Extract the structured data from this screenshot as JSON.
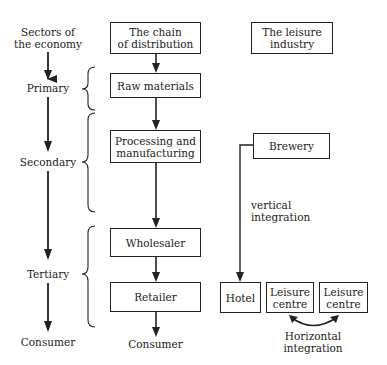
{
  "sectors": {
    "heading_line1": "Sectors of",
    "heading_line2": "the economy",
    "primary": "Primary",
    "secondary": "Secondary",
    "tertiary": "Tertiary",
    "consumer": "Consumer"
  },
  "chain": {
    "heading_line1": "The chain",
    "heading_line2": "of distribution",
    "raw_materials": "Raw materials",
    "processing_line1": "Processing and",
    "processing_line2": "manufacturing",
    "wholesaler": "Wholesaler",
    "retailer": "Retailer",
    "consumer": "Consumer"
  },
  "leisure": {
    "heading_line1": "The leisure",
    "heading_line2": "industry",
    "brewery": "Brewery",
    "vertical_line1": "vertical",
    "vertical_line2": "integration",
    "hotel": "Hotel",
    "leisure_centre_1_line1": "Leisure",
    "leisure_centre_1_line2": "centre",
    "leisure_centre_2_line1": "Leisure",
    "leisure_centre_2_line2": "centre",
    "horizontal_line1": "Horizontal",
    "horizontal_line2": "integration"
  }
}
